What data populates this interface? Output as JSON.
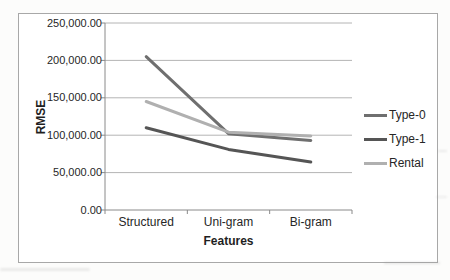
{
  "chart_data": {
    "type": "line",
    "title": "",
    "xlabel": "Features",
    "ylabel": "RMSE",
    "categories": [
      "Structured",
      "Uni-gram",
      "Bi-gram"
    ],
    "series": [
      {
        "name": "Type-0",
        "color": "#6f6f6f",
        "values": [
          205000,
          102000,
          93000
        ]
      },
      {
        "name": "Type-1",
        "color": "#555555",
        "values": [
          110000,
          81000,
          64000
        ]
      },
      {
        "name": "Rental",
        "color": "#b0b0b0",
        "values": [
          145000,
          104000,
          99000
        ]
      }
    ],
    "ylim": [
      0,
      250000
    ],
    "ytick_step": 50000,
    "ytick_labels": [
      "0.00",
      "50,000.00",
      "100,000.00",
      "150,000.00",
      "200,000.00",
      "250,000.00"
    ],
    "grid": true,
    "legend_position": "right",
    "colors": {
      "text": "#262626",
      "gridline": "#b4b4b4",
      "axis": "#8a8a8a",
      "frame_border": "#a8a8a8",
      "background": "#ffffff"
    }
  }
}
